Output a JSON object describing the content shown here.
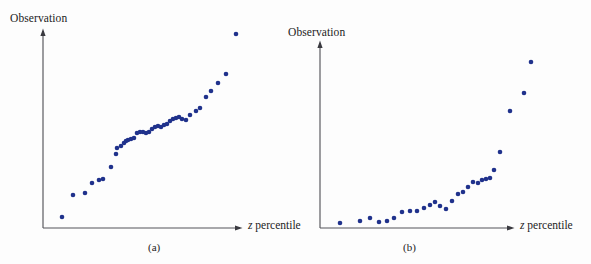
{
  "figure": {
    "background_color": "#fdfdfd",
    "point_color": "#20328c",
    "axis_color": "#55555a"
  },
  "panels": [
    {
      "id": "a",
      "caption": "(a)",
      "y_axis_label": "Observation",
      "x_axis_label_italic": "z",
      "x_axis_label_rest": " percentile",
      "origin": {
        "x": 43,
        "y": 228
      },
      "axis_top_y": 31,
      "axis_right_x": 240
    },
    {
      "id": "b",
      "caption": "(b)",
      "y_axis_label": "Observation",
      "x_axis_label_italic": "z",
      "x_axis_label_rest": " percentile",
      "origin": {
        "x": 320,
        "y": 228
      },
      "axis_top_y": 43,
      "axis_right_x": 512
    }
  ],
  "chart_data": [
    {
      "type": "scatter",
      "title": "(a)",
      "xlabel": "z percentile",
      "ylabel": "Observation",
      "grid": false,
      "legend": "none",
      "xlim": [
        43,
        245
      ],
      "ylim": [
        228,
        31
      ],
      "marker_color": "#20328c",
      "marker_radius": 2.3,
      "n_points": 40,
      "points": [
        [
          62,
          217
        ],
        [
          73,
          195
        ],
        [
          85,
          193
        ],
        [
          92,
          183
        ],
        [
          99,
          180
        ],
        [
          103,
          179
        ],
        [
          111,
          167
        ],
        [
          116,
          154
        ],
        [
          117,
          148
        ],
        [
          121,
          146
        ],
        [
          124,
          143
        ],
        [
          126,
          141
        ],
        [
          128,
          140
        ],
        [
          131,
          139
        ],
        [
          134,
          138
        ],
        [
          137,
          133
        ],
        [
          140,
          132
        ],
        [
          143,
          132
        ],
        [
          146,
          133
        ],
        [
          149,
          132
        ],
        [
          152,
          129
        ],
        [
          155,
          127
        ],
        [
          158,
          126
        ],
        [
          161,
          127
        ],
        [
          164,
          125
        ],
        [
          167,
          124
        ],
        [
          170,
          121
        ],
        [
          173,
          119
        ],
        [
          176,
          118
        ],
        [
          179,
          117
        ],
        [
          182,
          119
        ],
        [
          186,
          120
        ],
        [
          190,
          115
        ],
        [
          196,
          111
        ],
        [
          200,
          108
        ],
        [
          206,
          97
        ],
        [
          211,
          91
        ],
        [
          218,
          83
        ],
        [
          226,
          74
        ],
        [
          236,
          34
        ]
      ]
    },
    {
      "type": "scatter",
      "title": "(b)",
      "xlabel": "z percentile",
      "ylabel": "Observation",
      "grid": false,
      "legend": "none",
      "xlim": [
        320,
        520
      ],
      "ylim": [
        228,
        43
      ],
      "marker_color": "#20328c",
      "marker_radius": 2.3,
      "n_points": 30,
      "points": [
        [
          340,
          223
        ],
        [
          360,
          221
        ],
        [
          370,
          218
        ],
        [
          379,
          222
        ],
        [
          387,
          221
        ],
        [
          394,
          218
        ],
        [
          402,
          212
        ],
        [
          410,
          211
        ],
        [
          417,
          211
        ],
        [
          424,
          208
        ],
        [
          430,
          205
        ],
        [
          435,
          202
        ],
        [
          440,
          206
        ],
        [
          446,
          209
        ],
        [
          452,
          201
        ],
        [
          458,
          194
        ],
        [
          463,
          192
        ],
        [
          468,
          187
        ],
        [
          473,
          182
        ],
        [
          478,
          183
        ],
        [
          482,
          180
        ],
        [
          486,
          179
        ],
        [
          490,
          178
        ],
        [
          494,
          170
        ],
        [
          500,
          152
        ],
        [
          510,
          111
        ],
        [
          524,
          93
        ],
        [
          531,
          62
        ]
      ]
    }
  ]
}
